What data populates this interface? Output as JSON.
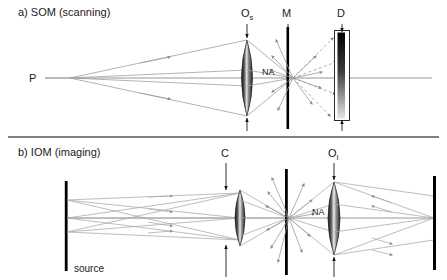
{
  "figure": {
    "width": 447,
    "height": 280,
    "background": "#ffffff"
  },
  "panels": [
    {
      "id": "a",
      "label": "a) SOM (scanning)",
      "label_x": 18,
      "label_y": 16,
      "axis_y": 78,
      "source_label": "P",
      "source_label_x": 29,
      "source_label_y": 82,
      "na_label": "NA",
      "na_label_x": 262,
      "na_label_y": 75,
      "components": [
        {
          "name": "objective-scanning",
          "label": "O",
          "sub": "s",
          "label_x": 241,
          "label_y": 17,
          "x": 247
        },
        {
          "name": "mask",
          "label": "M",
          "sub": "",
          "label_x": 282,
          "label_y": 17,
          "x": 288
        },
        {
          "name": "detector",
          "label": "D",
          "sub": "",
          "label_x": 337,
          "label_y": 17,
          "x": 343
        }
      ]
    },
    {
      "id": "b",
      "label": "b) IOM (imaging)",
      "label_x": 18,
      "label_y": 156,
      "axis_y": 218,
      "source_label": "source",
      "source_label_x": 74,
      "source_label_y": 272,
      "na_label": "NA",
      "na_label_x": 312,
      "na_label_y": 215,
      "components": [
        {
          "name": "condenser",
          "label": "C",
          "sub": "",
          "label_x": 221,
          "label_y": 157,
          "x": 226
        },
        {
          "name": "objective-imaging",
          "label": "O",
          "sub": "I",
          "label_x": 328,
          "label_y": 157,
          "x": 334
        }
      ]
    }
  ],
  "colors": {
    "ray": "#9a9a9a",
    "ray_dark": "#7d7d7d",
    "bar_black": "#000000",
    "lens_dark": "#2a2a2a",
    "lens_light": "#f2f2f2",
    "text": "#1a1a1a",
    "arrow": "#1a1a1a"
  }
}
